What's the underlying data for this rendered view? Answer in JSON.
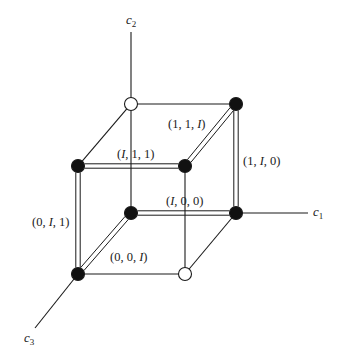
{
  "diagram": {
    "type": "cube-lattice",
    "colors": {
      "line": "#1a1a1a",
      "filled_node": "#111111",
      "open_node": "#ffffff",
      "background": "#ffffff"
    },
    "axes": [
      {
        "id": "c1",
        "base": "c",
        "sub": "1",
        "from": [
          236,
          213
        ],
        "to": [
          308,
          213
        ],
        "label_pos": [
          313,
          216
        ]
      },
      {
        "id": "c2",
        "base": "c",
        "sub": "2",
        "from": [
          131,
          104
        ],
        "to": [
          131,
          32
        ],
        "label_pos": [
          126,
          24
        ]
      },
      {
        "id": "c3",
        "base": "c",
        "sub": "3",
        "from": [
          78,
          274
        ],
        "to": [
          35,
          328
        ],
        "label_pos": [
          24,
          342
        ]
      }
    ],
    "nodes": [
      {
        "id": "top-back-left",
        "x": 131,
        "y": 104,
        "filled": false
      },
      {
        "id": "top-back-right",
        "x": 236,
        "y": 104,
        "filled": true
      },
      {
        "id": "top-front-left",
        "x": 78,
        "y": 166,
        "filled": true
      },
      {
        "id": "top-front-right",
        "x": 185,
        "y": 166,
        "filled": true
      },
      {
        "id": "bottom-back-left",
        "x": 131,
        "y": 213,
        "filled": true
      },
      {
        "id": "bottom-back-right",
        "x": 236,
        "y": 213,
        "filled": true
      },
      {
        "id": "bottom-front-left",
        "x": 78,
        "y": 274,
        "filled": true
      },
      {
        "id": "bottom-front-right",
        "x": 185,
        "y": 274,
        "filled": false
      }
    ],
    "edges": [
      {
        "from": "top-back-left",
        "to": "top-back-right",
        "double": false
      },
      {
        "from": "top-back-left",
        "to": "top-front-left",
        "double": false
      },
      {
        "from": "top-back-left",
        "to": "bottom-back-left",
        "double": false
      },
      {
        "from": "top-back-right",
        "to": "top-front-right",
        "double": true
      },
      {
        "from": "top-back-right",
        "to": "bottom-back-right",
        "double": true
      },
      {
        "from": "top-front-left",
        "to": "top-front-right",
        "double": true
      },
      {
        "from": "top-front-left",
        "to": "bottom-front-left",
        "double": true
      },
      {
        "from": "top-front-right",
        "to": "bottom-front-right",
        "double": false
      },
      {
        "from": "bottom-back-left",
        "to": "bottom-back-right",
        "double": true
      },
      {
        "from": "bottom-back-left",
        "to": "bottom-front-left",
        "double": true
      },
      {
        "from": "bottom-back-right",
        "to": "bottom-front-right",
        "double": false
      },
      {
        "from": "bottom-front-left",
        "to": "bottom-front-right",
        "double": false
      }
    ],
    "edge_labels": [
      {
        "id": "label-1-1-I",
        "text": "(1, 1, I)",
        "x": 168,
        "y": 128
      },
      {
        "id": "label-I-1-1",
        "text": "(I, 1, 1)",
        "x": 117,
        "y": 158
      },
      {
        "id": "label-1-I-0",
        "text": "(1, I, 0)",
        "x": 243,
        "y": 165
      },
      {
        "id": "label-I-0-0",
        "text": "(I, 0, 0)",
        "x": 166,
        "y": 205
      },
      {
        "id": "label-0-I-1",
        "text": "(0, I, 1)",
        "x": 32,
        "y": 226
      },
      {
        "id": "label-0-0-I",
        "text": "(0, 0, I)",
        "x": 110,
        "y": 261
      }
    ]
  }
}
